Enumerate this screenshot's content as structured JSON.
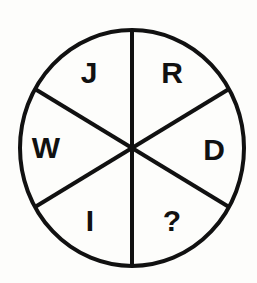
{
  "figure": {
    "name": "letter-wheel-puzzle",
    "type": "circle-divided-into-six-sectors",
    "background_color": "#fdfdfb",
    "stroke_color": "#111111",
    "stroke_width": 4,
    "circle": {
      "center_x": 132,
      "center_y": 148,
      "radius_x": 112,
      "radius_y": 118
    },
    "spokes": [
      {
        "name": "vertical-diameter",
        "angle_deg": 90
      },
      {
        "name": "diagonal-upper-left-to-lower-right",
        "angle_deg": 30
      },
      {
        "name": "diagonal-upper-right-to-lower-left",
        "angle_deg": 150
      }
    ],
    "sectors": [
      {
        "name": "sector-top-left",
        "label": "J",
        "x": 89,
        "y": 73
      },
      {
        "name": "sector-top-right",
        "label": "R",
        "x": 172,
        "y": 73
      },
      {
        "name": "sector-left",
        "label": "W",
        "x": 46,
        "y": 148
      },
      {
        "name": "sector-right",
        "label": "D",
        "x": 214,
        "y": 150
      },
      {
        "name": "sector-bottom-left",
        "label": "I",
        "x": 90,
        "y": 221
      },
      {
        "name": "sector-bottom-right",
        "label": "?",
        "x": 172,
        "y": 221
      }
    ]
  }
}
